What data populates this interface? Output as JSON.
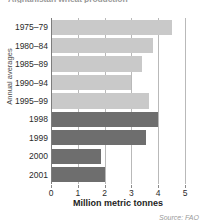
{
  "chart_data": {
    "type": "bar",
    "orientation": "horizontal",
    "title": "Afghanistan wheat production",
    "categories": [
      "1975–79",
      "1980–84",
      "1985–89",
      "1990–94",
      "1995–99",
      "1998",
      "1999",
      "2000",
      "2001"
    ],
    "values": [
      4.5,
      3.8,
      3.4,
      3.0,
      3.65,
      4.0,
      3.55,
      1.85,
      2.0
    ],
    "group": [
      "average",
      "average",
      "average",
      "average",
      "average",
      "year",
      "year",
      "year",
      "year"
    ],
    "series": [
      {
        "name": "Annual averages",
        "color": "#c9c9c9",
        "points": [
          {
            "category": "1975–79",
            "value": 4.5
          },
          {
            "category": "1980–84",
            "value": 3.8
          },
          {
            "category": "1985–89",
            "value": 3.4
          },
          {
            "category": "1990–94",
            "value": 3.0
          },
          {
            "category": "1995–99",
            "value": 3.65
          }
        ]
      },
      {
        "name": "Individual years",
        "color": "#6e6e6e",
        "points": [
          {
            "category": "1998",
            "value": 4.0
          },
          {
            "category": "1999",
            "value": 3.55
          },
          {
            "category": "2000",
            "value": 1.85
          },
          {
            "category": "2001",
            "value": 2.0
          }
        ]
      }
    ],
    "xlabel": "Million metric tonnes",
    "ylabel": "Annual averages",
    "xticks": [
      0,
      1,
      2,
      3,
      4,
      5
    ],
    "xtick_labels": [
      "0",
      "1",
      "2",
      "3",
      "4",
      "5"
    ],
    "xlim": [
      0,
      5
    ],
    "grid": true,
    "grid_axis": "x",
    "legend": "none",
    "source": "Source: FAO",
    "colors": {
      "light_bar": "#c9c9c9",
      "dark_bar": "#6e6e6e",
      "gridline": "#b9b9b9",
      "axis": "#7d7d7d",
      "text": "#2b2b2b",
      "title": "#9a9a9a",
      "source": "#9a9a9a",
      "background": "#ffffff"
    }
  }
}
